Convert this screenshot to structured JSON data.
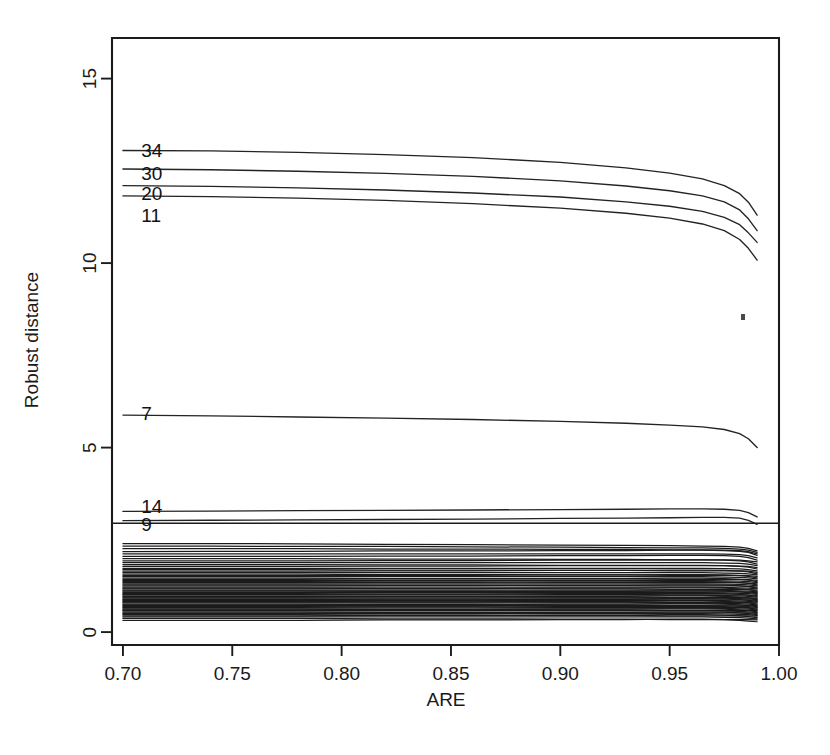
{
  "chart_data": {
    "type": "line",
    "title": "",
    "xlabel": "ARE",
    "ylabel": "Robust distance",
    "xlim": [
      0.695,
      1.0
    ],
    "ylim": [
      -0.35,
      16.1
    ],
    "grid": false,
    "legend": null,
    "xticks": [
      0.7,
      0.75,
      0.8,
      0.85,
      0.9,
      0.95,
      1.0
    ],
    "xticklabels": [
      "0.70",
      "0.75",
      "0.80",
      "0.85",
      "0.90",
      "0.95",
      "1.00"
    ],
    "yticks": [
      0,
      5,
      10,
      15
    ],
    "yticklabels": [
      "0",
      "5",
      "10",
      "15"
    ],
    "x": [
      0.7,
      0.74,
      0.78,
      0.82,
      0.86,
      0.9,
      0.93,
      0.95,
      0.965,
      0.975,
      0.982,
      0.986,
      0.99
    ],
    "annotations": [
      {
        "text": "34",
        "x": 0.702,
        "y": 13.05,
        "role": "observation-label"
      },
      {
        "text": "30",
        "x": 0.702,
        "y": 12.42,
        "role": "observation-label"
      },
      {
        "text": "20",
        "x": 0.702,
        "y": 11.88,
        "role": "observation-label"
      },
      {
        "text": "11",
        "x": 0.702,
        "y": 11.28,
        "role": "observation-label"
      },
      {
        "text": "7",
        "x": 0.702,
        "y": 5.92,
        "role": "observation-label"
      },
      {
        "text": "14",
        "x": 0.702,
        "y": 3.38,
        "role": "observation-label"
      },
      {
        "text": "9",
        "x": 0.702,
        "y": 2.9,
        "role": "observation-label"
      }
    ],
    "threshold": {
      "value": 2.95,
      "label": "",
      "spans_full_width": true
    },
    "series": [
      {
        "name": "34",
        "label": "34",
        "labelled": true,
        "values": [
          13.05,
          13.04,
          13.0,
          12.94,
          12.86,
          12.73,
          12.58,
          12.44,
          12.28,
          12.1,
          11.88,
          11.65,
          11.3
        ]
      },
      {
        "name": "30",
        "label": "30",
        "labelled": true,
        "values": [
          12.55,
          12.53,
          12.49,
          12.43,
          12.35,
          12.23,
          12.09,
          11.96,
          11.82,
          11.66,
          11.44,
          11.2,
          10.88
        ]
      },
      {
        "name": "20",
        "label": "20",
        "labelled": true,
        "values": [
          12.1,
          12.08,
          12.04,
          11.98,
          11.9,
          11.79,
          11.66,
          11.54,
          11.4,
          11.24,
          11.04,
          10.82,
          10.56
        ]
      },
      {
        "name": "11",
        "label": "11",
        "labelled": true,
        "values": [
          11.82,
          11.8,
          11.76,
          11.7,
          11.61,
          11.49,
          11.35,
          11.22,
          11.06,
          10.88,
          10.64,
          10.4,
          10.08
        ]
      },
      {
        "name": "7",
        "label": "7",
        "labelled": true,
        "values": [
          5.88,
          5.86,
          5.83,
          5.8,
          5.76,
          5.71,
          5.66,
          5.61,
          5.56,
          5.49,
          5.38,
          5.24,
          5.0
        ]
      },
      {
        "name": "14",
        "label": "14",
        "labelled": true,
        "values": [
          3.27,
          3.28,
          3.29,
          3.3,
          3.31,
          3.32,
          3.33,
          3.34,
          3.34,
          3.33,
          3.3,
          3.24,
          3.12
        ]
      },
      {
        "name": "9",
        "label": "9",
        "labelled": true,
        "values": [
          3.02,
          3.03,
          3.04,
          3.05,
          3.06,
          3.08,
          3.09,
          3.1,
          3.11,
          3.11,
          3.09,
          3.03,
          2.92
        ]
      }
    ],
    "bundle": {
      "description": "dense bundle of unlabelled observation traces below the cut-off",
      "count": 62,
      "y_range": [
        0.28,
        2.42
      ],
      "values": [
        [
          2.4,
          2.4,
          2.39,
          2.38,
          2.37,
          2.36,
          2.35,
          2.34,
          2.33,
          2.32,
          2.3,
          2.27,
          2.2
        ],
        [
          2.33,
          2.33,
          2.32,
          2.32,
          2.31,
          2.3,
          2.29,
          2.28,
          2.28,
          2.27,
          2.25,
          2.22,
          2.16
        ],
        [
          2.26,
          2.26,
          2.26,
          2.25,
          2.25,
          2.24,
          2.24,
          2.23,
          2.23,
          2.22,
          2.21,
          2.18,
          2.12
        ],
        [
          2.18,
          2.19,
          2.19,
          2.2,
          2.2,
          2.21,
          2.21,
          2.22,
          2.22,
          2.21,
          2.19,
          2.16,
          2.08
        ],
        [
          2.12,
          2.12,
          2.12,
          2.12,
          2.12,
          2.12,
          2.12,
          2.12,
          2.12,
          2.11,
          2.1,
          2.07,
          2.01
        ],
        [
          2.05,
          2.05,
          2.05,
          2.06,
          2.06,
          2.07,
          2.07,
          2.08,
          2.08,
          2.07,
          2.05,
          2.02,
          1.95
        ],
        [
          1.99,
          1.99,
          1.99,
          1.98,
          1.98,
          1.97,
          1.97,
          1.96,
          1.96,
          1.96,
          1.95,
          1.93,
          1.9
        ],
        [
          1.93,
          1.93,
          1.93,
          1.94,
          1.94,
          1.95,
          1.95,
          1.96,
          1.96,
          1.95,
          1.93,
          1.9,
          1.84
        ],
        [
          1.88,
          1.88,
          1.88,
          1.88,
          1.88,
          1.88,
          1.88,
          1.88,
          1.88,
          1.87,
          1.86,
          1.84,
          1.8
        ],
        [
          1.83,
          1.83,
          1.83,
          1.82,
          1.82,
          1.81,
          1.81,
          1.8,
          1.8,
          1.8,
          1.79,
          1.78,
          1.75
        ],
        [
          1.78,
          1.78,
          1.78,
          1.79,
          1.79,
          1.8,
          1.8,
          1.81,
          1.81,
          1.8,
          1.78,
          1.76,
          1.71
        ],
        [
          1.73,
          1.73,
          1.73,
          1.73,
          1.73,
          1.73,
          1.73,
          1.73,
          1.73,
          1.72,
          1.71,
          1.69,
          1.66
        ],
        [
          1.69,
          1.69,
          1.69,
          1.68,
          1.68,
          1.67,
          1.67,
          1.66,
          1.66,
          1.66,
          1.66,
          1.65,
          1.62
        ],
        [
          1.65,
          1.65,
          1.65,
          1.66,
          1.66,
          1.67,
          1.67,
          1.68,
          1.68,
          1.67,
          1.65,
          1.63,
          1.58
        ],
        [
          1.61,
          1.61,
          1.61,
          1.61,
          1.61,
          1.61,
          1.61,
          1.61,
          1.61,
          1.6,
          1.59,
          1.58,
          1.55
        ],
        [
          1.57,
          1.57,
          1.57,
          1.56,
          1.56,
          1.55,
          1.55,
          1.54,
          1.54,
          1.54,
          1.54,
          1.53,
          1.51
        ],
        [
          1.53,
          1.53,
          1.53,
          1.54,
          1.54,
          1.55,
          1.55,
          1.56,
          1.56,
          1.55,
          1.53,
          1.51,
          1.47
        ],
        [
          1.5,
          1.5,
          1.5,
          1.5,
          1.5,
          1.5,
          1.5,
          1.5,
          1.5,
          1.49,
          1.48,
          1.47,
          1.44
        ],
        [
          1.46,
          1.46,
          1.46,
          1.45,
          1.45,
          1.44,
          1.44,
          1.43,
          1.43,
          1.43,
          1.43,
          1.42,
          1.4
        ],
        [
          1.43,
          1.43,
          1.43,
          1.44,
          1.44,
          1.45,
          1.45,
          1.46,
          1.46,
          1.45,
          1.43,
          1.41,
          1.37
        ],
        [
          1.4,
          1.4,
          1.4,
          1.4,
          1.4,
          1.4,
          1.4,
          1.4,
          1.4,
          1.39,
          1.38,
          1.37,
          1.34
        ],
        [
          1.37,
          1.37,
          1.37,
          1.36,
          1.36,
          1.35,
          1.35,
          1.34,
          1.34,
          1.34,
          1.34,
          1.33,
          1.31
        ],
        [
          1.34,
          1.34,
          1.34,
          1.35,
          1.35,
          1.36,
          1.36,
          1.37,
          1.37,
          1.36,
          1.34,
          1.32,
          1.28
        ],
        [
          1.31,
          1.31,
          1.31,
          1.31,
          1.31,
          1.31,
          1.31,
          1.31,
          1.31,
          1.3,
          1.29,
          1.28,
          1.25
        ],
        [
          1.28,
          1.28,
          1.28,
          1.27,
          1.27,
          1.26,
          1.26,
          1.25,
          1.25,
          1.25,
          1.25,
          1.24,
          1.22
        ],
        [
          1.25,
          1.25,
          1.25,
          1.26,
          1.26,
          1.27,
          1.27,
          1.28,
          1.28,
          1.27,
          1.25,
          1.23,
          1.19
        ],
        [
          1.22,
          1.22,
          1.22,
          1.22,
          1.22,
          1.22,
          1.22,
          1.22,
          1.22,
          1.21,
          1.2,
          1.19,
          1.17
        ],
        [
          1.19,
          1.19,
          1.19,
          1.18,
          1.18,
          1.17,
          1.17,
          1.16,
          1.16,
          1.16,
          1.16,
          1.15,
          1.14
        ],
        [
          1.17,
          1.17,
          1.17,
          1.18,
          1.18,
          1.19,
          1.19,
          1.2,
          1.2,
          1.19,
          1.17,
          1.15,
          1.11
        ],
        [
          1.14,
          1.14,
          1.14,
          1.14,
          1.14,
          1.14,
          1.14,
          1.14,
          1.14,
          1.13,
          1.12,
          1.11,
          1.09
        ],
        [
          1.12,
          1.12,
          1.12,
          1.11,
          1.11,
          1.1,
          1.1,
          1.09,
          1.09,
          1.09,
          1.09,
          1.08,
          1.07
        ],
        [
          1.09,
          1.09,
          1.09,
          1.1,
          1.1,
          1.11,
          1.11,
          1.12,
          1.12,
          1.11,
          1.09,
          1.07,
          1.04
        ],
        [
          1.07,
          1.07,
          1.07,
          1.07,
          1.07,
          1.07,
          1.07,
          1.07,
          1.07,
          1.06,
          1.05,
          1.04,
          1.02
        ],
        [
          1.04,
          1.04,
          1.04,
          1.03,
          1.03,
          1.02,
          1.02,
          1.01,
          1.01,
          1.01,
          1.01,
          1.0,
          0.99
        ],
        [
          1.02,
          1.02,
          1.02,
          1.03,
          1.03,
          1.04,
          1.04,
          1.05,
          1.05,
          1.04,
          1.02,
          1.0,
          0.97
        ],
        [
          1.0,
          1.0,
          1.0,
          1.0,
          1.0,
          1.0,
          1.0,
          1.0,
          1.0,
          0.99,
          0.98,
          0.97,
          0.95
        ],
        [
          0.97,
          0.97,
          0.97,
          0.96,
          0.96,
          0.95,
          0.95,
          0.94,
          0.94,
          0.94,
          0.94,
          0.93,
          0.92
        ],
        [
          0.95,
          0.95,
          0.95,
          0.96,
          0.96,
          0.97,
          0.97,
          0.98,
          0.98,
          0.97,
          0.95,
          0.93,
          0.9
        ],
        [
          0.93,
          0.93,
          0.93,
          0.93,
          0.93,
          0.93,
          0.93,
          0.93,
          0.93,
          0.92,
          0.91,
          0.9,
          0.88
        ],
        [
          0.9,
          0.9,
          0.9,
          0.89,
          0.89,
          0.88,
          0.88,
          0.87,
          0.87,
          0.87,
          0.87,
          0.87,
          0.86
        ],
        [
          0.88,
          0.88,
          0.88,
          0.89,
          0.89,
          0.9,
          0.9,
          0.91,
          0.91,
          0.9,
          0.88,
          0.86,
          0.83
        ],
        [
          0.86,
          0.86,
          0.86,
          0.86,
          0.86,
          0.86,
          0.86,
          0.86,
          0.86,
          0.85,
          0.84,
          0.83,
          0.81
        ],
        [
          0.83,
          0.83,
          0.83,
          0.82,
          0.82,
          0.81,
          0.81,
          0.8,
          0.8,
          0.8,
          0.8,
          0.8,
          0.79
        ],
        [
          0.81,
          0.81,
          0.81,
          0.82,
          0.82,
          0.83,
          0.83,
          0.84,
          0.84,
          0.83,
          0.81,
          0.79,
          0.76
        ],
        [
          0.79,
          0.79,
          0.79,
          0.79,
          0.79,
          0.79,
          0.79,
          0.79,
          0.79,
          0.78,
          0.77,
          0.76,
          0.74
        ],
        [
          0.76,
          0.76,
          0.76,
          0.75,
          0.75,
          0.74,
          0.74,
          0.73,
          0.73,
          0.73,
          0.73,
          0.73,
          0.72
        ],
        [
          0.74,
          0.74,
          0.74,
          0.75,
          0.75,
          0.76,
          0.76,
          0.77,
          0.77,
          0.76,
          0.74,
          0.72,
          0.69
        ],
        [
          0.72,
          0.72,
          0.72,
          0.72,
          0.72,
          0.72,
          0.72,
          0.72,
          0.72,
          0.71,
          0.7,
          0.69,
          0.67
        ],
        [
          0.69,
          0.69,
          0.69,
          0.68,
          0.68,
          0.67,
          0.67,
          0.66,
          0.66,
          0.66,
          0.66,
          0.66,
          0.65
        ],
        [
          0.67,
          0.67,
          0.67,
          0.68,
          0.68,
          0.69,
          0.69,
          0.7,
          0.7,
          0.69,
          0.67,
          0.65,
          0.62
        ],
        [
          0.65,
          0.65,
          0.65,
          0.65,
          0.65,
          0.65,
          0.65,
          0.65,
          0.65,
          0.64,
          0.63,
          0.62,
          0.6
        ],
        [
          0.62,
          0.62,
          0.62,
          0.61,
          0.61,
          0.6,
          0.6,
          0.59,
          0.59,
          0.59,
          0.59,
          0.59,
          0.58
        ],
        [
          0.6,
          0.6,
          0.6,
          0.61,
          0.61,
          0.62,
          0.62,
          0.63,
          0.63,
          0.62,
          0.6,
          0.58,
          0.55
        ],
        [
          0.58,
          0.58,
          0.58,
          0.58,
          0.58,
          0.58,
          0.58,
          0.58,
          0.58,
          0.57,
          0.56,
          0.55,
          0.53
        ],
        [
          0.55,
          0.55,
          0.55,
          0.54,
          0.54,
          0.53,
          0.53,
          0.52,
          0.52,
          0.52,
          0.52,
          0.52,
          0.51
        ],
        [
          0.52,
          0.52,
          0.52,
          0.53,
          0.53,
          0.54,
          0.54,
          0.55,
          0.55,
          0.54,
          0.52,
          0.5,
          0.47
        ],
        [
          0.5,
          0.5,
          0.5,
          0.5,
          0.5,
          0.5,
          0.5,
          0.5,
          0.5,
          0.49,
          0.48,
          0.47,
          0.45
        ],
        [
          0.47,
          0.47,
          0.47,
          0.46,
          0.46,
          0.45,
          0.45,
          0.44,
          0.44,
          0.44,
          0.44,
          0.44,
          0.43
        ],
        [
          0.44,
          0.44,
          0.44,
          0.45,
          0.45,
          0.46,
          0.46,
          0.47,
          0.47,
          0.46,
          0.44,
          0.42,
          0.39
        ],
        [
          0.41,
          0.41,
          0.41,
          0.41,
          0.41,
          0.41,
          0.41,
          0.41,
          0.41,
          0.4,
          0.39,
          0.38,
          0.36
        ],
        [
          0.37,
          0.37,
          0.37,
          0.36,
          0.36,
          0.35,
          0.35,
          0.34,
          0.34,
          0.34,
          0.34,
          0.34,
          0.33
        ],
        [
          0.32,
          0.32,
          0.32,
          0.33,
          0.33,
          0.34,
          0.34,
          0.35,
          0.35,
          0.34,
          0.32,
          0.3,
          0.28
        ]
      ]
    }
  }
}
